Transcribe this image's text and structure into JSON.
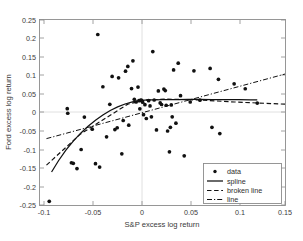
{
  "chart_data": {
    "type": "scatter",
    "title": "",
    "xlabel": "S&P excess log return",
    "ylabel": "Ford excess log return",
    "xlim": [
      -0.11,
      0.155
    ],
    "ylim": [
      -0.255,
      0.255
    ],
    "xticks": [
      -0.1,
      -0.05,
      0,
      0.05,
      0.1,
      0.15
    ],
    "xticklabels": [
      "-0.1",
      "-0.05",
      "0",
      "0.05",
      "0.1",
      "0.15"
    ],
    "yticks": [
      -0.25,
      -0.2,
      -0.15,
      -0.1,
      -0.05,
      0,
      0.05,
      0.1,
      0.15,
      0.2,
      0.25
    ],
    "yticklabels": [
      "-0.25",
      "-0.2",
      "-0.15",
      "-0.1",
      "-0.05",
      "0",
      "0.05",
      "0.1",
      "0.15",
      "0.2",
      "0.25"
    ],
    "grid": false,
    "legend_position": "lower right",
    "legend": [
      {
        "key": "data",
        "label": "data",
        "style": "marker"
      },
      {
        "key": "spline",
        "label": "spline",
        "style": "solid"
      },
      {
        "key": "broken",
        "label": "broken line",
        "style": "dashed"
      },
      {
        "key": "line",
        "label": "line",
        "style": "dashdot"
      }
    ],
    "marker_color": "#111111",
    "line_color": "#111111",
    "series": [
      {
        "name": "data",
        "type": "scatter",
        "points": [
          [
            -0.1,
            -0.245
          ],
          [
            -0.0805,
            0.0105
          ],
          [
            -0.08,
            -0.002
          ],
          [
            -0.076,
            -0.1385
          ],
          [
            -0.074,
            -0.14
          ],
          [
            -0.07,
            -0.1545
          ],
          [
            -0.0655,
            -0.102
          ],
          [
            -0.062,
            -0.0125
          ],
          [
            -0.0535,
            -0.046
          ],
          [
            -0.05,
            -0.141
          ],
          [
            -0.0475,
            0.215
          ],
          [
            -0.0455,
            -0.1505
          ],
          [
            -0.042,
            0.071
          ],
          [
            -0.038,
            -0.067
          ],
          [
            -0.0345,
            0.0225
          ],
          [
            -0.032,
            0.0995
          ],
          [
            -0.029,
            -0.047
          ],
          [
            -0.0265,
            -0.042
          ],
          [
            -0.025,
            0.0955
          ],
          [
            -0.0215,
            -0.114
          ],
          [
            -0.02,
            -0.022
          ],
          [
            -0.0175,
            0.114
          ],
          [
            -0.015,
            0.127
          ],
          [
            -0.014,
            -0.035
          ],
          [
            -0.011,
            0.066
          ],
          [
            -0.0095,
            0.1425
          ],
          [
            -0.008,
            0.0365
          ],
          [
            -0.006,
            0.029
          ],
          [
            -0.004,
            0.07
          ],
          [
            -0.003,
            0.0325
          ],
          [
            -0.002,
            0.01
          ],
          [
            -0.001,
            0.034
          ],
          [
            0.0,
            0.0335
          ],
          [
            0.001,
            0.0285
          ],
          [
            0.002,
            -0.006
          ],
          [
            0.0035,
            0.0215
          ],
          [
            0.005,
            -0.0165
          ],
          [
            0.0075,
            0.0325
          ],
          [
            0.009,
            0.018
          ],
          [
            0.0105,
            -0.012
          ],
          [
            0.012,
            0.168
          ],
          [
            0.0135,
            0.0345
          ],
          [
            0.016,
            -0.048
          ],
          [
            0.018,
            0.0595
          ],
          [
            0.02,
            0.0265
          ],
          [
            0.0215,
            0.022
          ],
          [
            0.024,
            0.0645
          ],
          [
            0.0255,
            0.0605
          ],
          [
            0.0265,
            0.02
          ],
          [
            0.028,
            -0.051
          ],
          [
            0.03,
            -0.1085
          ],
          [
            0.031,
            -0.041
          ],
          [
            0.032,
            0.021
          ],
          [
            0.033,
            -0.012
          ],
          [
            0.0345,
            0.1175
          ],
          [
            0.037,
            -0.0295
          ],
          [
            0.0395,
            0.136
          ],
          [
            0.042,
            0.0465
          ],
          [
            0.046,
            -0.1195
          ],
          [
            0.0525,
            0.029
          ],
          [
            0.0565,
            0.115
          ],
          [
            0.063,
            0.034
          ],
          [
            0.074,
            0.1215
          ],
          [
            0.076,
            -0.041
          ],
          [
            0.083,
            0.0915
          ],
          [
            0.0845,
            -0.058
          ],
          [
            0.1,
            0.079
          ],
          [
            0.112,
            0.0655
          ],
          [
            0.125,
            0.026
          ]
        ]
      },
      {
        "name": "spline",
        "type": "line",
        "style": "solid",
        "points": [
          [
            -0.0975,
            -0.164
          ],
          [
            -0.09,
            -0.133
          ],
          [
            -0.082,
            -0.104
          ],
          [
            -0.074,
            -0.079
          ],
          [
            -0.066,
            -0.057
          ],
          [
            -0.058,
            -0.038
          ],
          [
            -0.05,
            -0.0215
          ],
          [
            -0.042,
            -0.007
          ],
          [
            -0.034,
            0.0055
          ],
          [
            -0.026,
            0.0155
          ],
          [
            -0.018,
            0.0235
          ],
          [
            -0.01,
            0.0295
          ],
          [
            -0.002,
            0.033
          ],
          [
            0.006,
            0.0345
          ],
          [
            0.014,
            0.035
          ],
          [
            0.022,
            0.0352
          ],
          [
            0.03,
            0.0355
          ],
          [
            0.04,
            0.0358
          ],
          [
            0.05,
            0.036
          ],
          [
            0.062,
            0.036
          ],
          [
            0.076,
            0.0358
          ],
          [
            0.09,
            0.0355
          ],
          [
            0.105,
            0.0352
          ],
          [
            0.118,
            0.035
          ],
          [
            0.125,
            0.035
          ]
        ]
      },
      {
        "name": "broken line",
        "type": "line",
        "style": "dashed",
        "points": [
          [
            -0.103,
            -0.145
          ],
          [
            -0.066,
            -0.059
          ],
          [
            -0.015,
            0.023
          ],
          [
            0.004,
            0.034
          ],
          [
            0.025,
            0.037
          ],
          [
            0.063,
            0.0345
          ],
          [
            0.1,
            0.029
          ],
          [
            0.155,
            0.023
          ]
        ]
      },
      {
        "name": "line",
        "type": "line",
        "style": "dashdot",
        "points": [
          [
            -0.103,
            -0.072
          ],
          [
            0.155,
            0.106
          ]
        ]
      }
    ]
  },
  "axes": {
    "x_label": "S&P excess log return",
    "y_label": "Ford excess log return"
  }
}
